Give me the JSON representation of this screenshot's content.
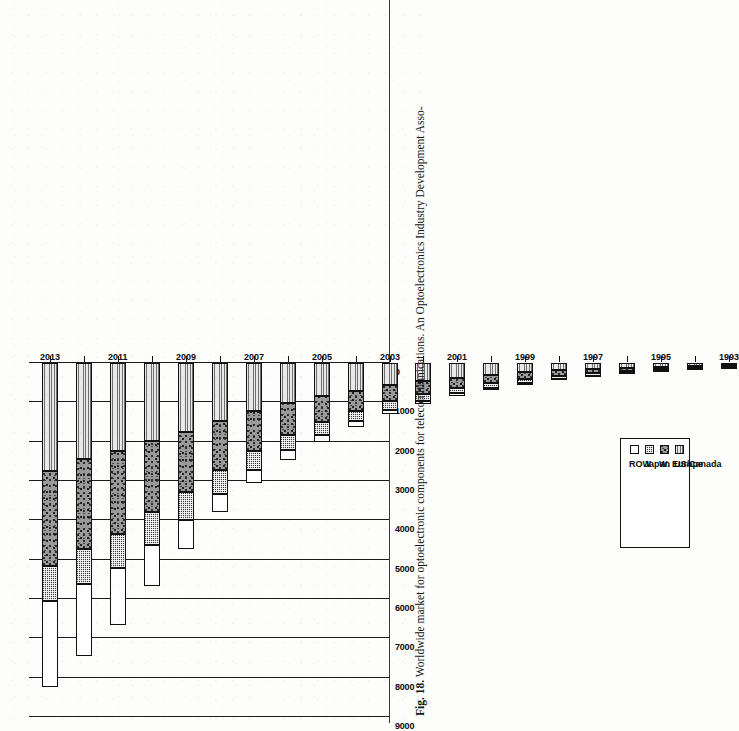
{
  "figure": {
    "number": "Fig. 18.",
    "caption": "Worldwide market for optoelectronic components for telecommunications. An Optoelectronics Industry Development Asso-"
  },
  "legend": {
    "position": "inside-lower-left",
    "entries": [
      {
        "label": "ROW",
        "swatch": "white-plain",
        "color": "#ffffff"
      },
      {
        "label": "Japan",
        "swatch": "dark-grid-hatch",
        "color": "#3a3a3a"
      },
      {
        "label": "W. Europe",
        "swatch": "speckled-gray",
        "color": "#9a9a9a"
      },
      {
        "label": "US/Canada",
        "swatch": "light-gray-horiz-lines",
        "color": "#e9e9e9"
      }
    ]
  },
  "axis": {
    "value_axis_title": "",
    "value_ticks": [
      "9000",
      "8000",
      "7000",
      "6000",
      "5000",
      "4000",
      "3000",
      "2000",
      "1000",
      "0"
    ],
    "value_min": 0,
    "value_max": 9000,
    "category_axis_title": "",
    "year_ticks": [
      "1993",
      "1995",
      "1997",
      "1999",
      "2001",
      "2003",
      "2005",
      "2007",
      "2009",
      "2011",
      "2013"
    ]
  },
  "chart_data": {
    "type": "bar",
    "orientation": "horizontal-stacked",
    "title": "Worldwide market for optoelectronic components for telecommunications",
    "xlabel": "",
    "ylabel": "",
    "xlim": [
      0,
      9000
    ],
    "grid": true,
    "legend_position": "inside-lower-left",
    "categories": [
      "1993",
      "1994",
      "1995",
      "1996",
      "1997",
      "1998",
      "1999",
      "2000",
      "2001",
      "2002",
      "2003",
      "2004",
      "2005",
      "2006",
      "2007",
      "2008",
      "2009",
      "2010",
      "2011",
      "2012",
      "2013"
    ],
    "series": [
      {
        "name": "US/Canada",
        "values": [
          60,
          75,
          95,
          120,
          150,
          190,
          240,
          300,
          370,
          450,
          560,
          700,
          850,
          1020,
          1230,
          1480,
          1760,
          1980,
          2240,
          2450,
          2750
        ]
      },
      {
        "name": "W. Europe",
        "values": [
          45,
          55,
          70,
          90,
          110,
          140,
          175,
          215,
          265,
          330,
          410,
          510,
          640,
          800,
          1000,
          1250,
          1520,
          1810,
          2100,
          2280,
          2420
        ]
      },
      {
        "name": "Japan",
        "values": [
          30,
          35,
          45,
          55,
          65,
          80,
          95,
          115,
          140,
          175,
          215,
          265,
          330,
          400,
          490,
          600,
          720,
          830,
          880,
          890,
          890
        ]
      },
      {
        "name": "ROW",
        "values": [
          10,
          12,
          15,
          20,
          25,
          32,
          42,
          55,
          70,
          90,
          115,
          150,
          195,
          255,
          330,
          470,
          720,
          1050,
          1430,
          1840,
          2180
        ]
      }
    ],
    "stack_order": [
      "ROW",
      "Japan",
      "W. Europe",
      "US/Canada"
    ],
    "totals": [
      145,
      177,
      225,
      285,
      350,
      442,
      552,
      685,
      845,
      1045,
      1300,
      1625,
      2015,
      2475,
      3050,
      3800,
      4720,
      5670,
      6650,
      7460,
      8240
    ]
  }
}
